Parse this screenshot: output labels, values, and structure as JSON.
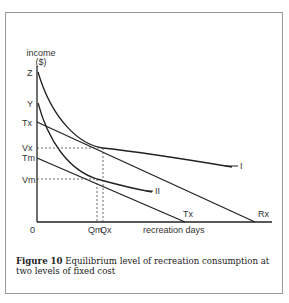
{
  "figure": {
    "y_axis_label": "income",
    "y_axis_unit": "($)",
    "x_axis_label": "recreation days",
    "origin_label": "0",
    "y_labels": {
      "z": "Z",
      "y": "Y",
      "tx": "Tx",
      "vx": "Vx",
      "tm": "Tm",
      "vm": "Vm"
    },
    "x_labels": {
      "qm": "Qm",
      "qx": "Qx",
      "tx": "Tx",
      "rx": "Rx"
    },
    "curve_labels": {
      "one": "I",
      "two": "II"
    }
  },
  "caption": {
    "number": "Figure 10",
    "text": "Equilibrium level of recreation consumption at two levels of fixed cost"
  }
}
